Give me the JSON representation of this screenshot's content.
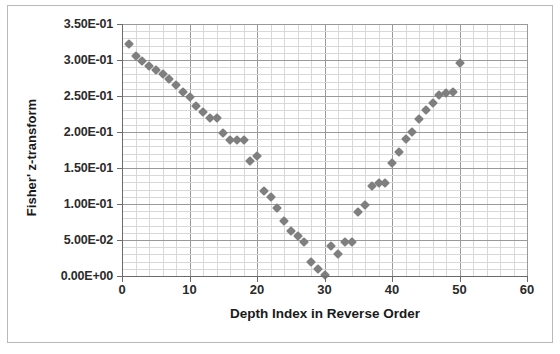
{
  "chart_data": {
    "type": "scatter",
    "title": "",
    "xlabel": "Depth Index in Reverse Order",
    "ylabel": "Fisher' z-transform",
    "xlim": [
      0,
      60
    ],
    "ylim": [
      0,
      0.35
    ],
    "xticks": [
      0,
      10,
      20,
      30,
      40,
      50,
      60
    ],
    "xtick_labels": [
      "0",
      "10",
      "20",
      "30",
      "40",
      "50",
      "60"
    ],
    "yticks": [
      0,
      0.05,
      0.1,
      0.15,
      0.2,
      0.25,
      0.3,
      0.35
    ],
    "ytick_labels": [
      "0.00E+00",
      "5.00E-02",
      "1.00E-01",
      "1.50E-01",
      "2.00E-01",
      "2.50E-01",
      "3.00E-01",
      "3.50E-01"
    ],
    "grid": true,
    "grid_minor_x_step": 2,
    "grid_minor_y_step": 0.01,
    "legend": "none",
    "marker": "diamond",
    "marker_color": "#7f7f7f",
    "series": [
      {
        "name": "Fisher z-transform vs depth index",
        "x": [
          1,
          2,
          3,
          4,
          5,
          6,
          7,
          8,
          9,
          10,
          11,
          12,
          13,
          14,
          15,
          16,
          17,
          18,
          19,
          20,
          21,
          22,
          23,
          24,
          25,
          26,
          27,
          28,
          29,
          30,
          31,
          32,
          33,
          34,
          35,
          36,
          37,
          38,
          39,
          40,
          41,
          42,
          43,
          44,
          45,
          46,
          47,
          48,
          49,
          50
        ],
        "y": [
          0.322,
          0.306,
          0.298,
          0.292,
          0.286,
          0.281,
          0.273,
          0.265,
          0.256,
          0.248,
          0.236,
          0.228,
          0.219,
          0.22,
          0.199,
          0.189,
          0.189,
          0.189,
          0.16,
          0.166,
          0.118,
          0.11,
          0.094,
          0.076,
          0.063,
          0.055,
          0.047,
          0.02,
          0.01,
          0.002,
          0.042,
          0.031,
          0.047,
          0.047,
          0.089,
          0.098,
          0.125,
          0.129,
          0.129,
          0.157,
          0.172,
          0.19,
          0.2,
          0.218,
          0.231,
          0.24,
          0.251,
          0.254,
          0.256,
          0.296
        ]
      }
    ]
  }
}
